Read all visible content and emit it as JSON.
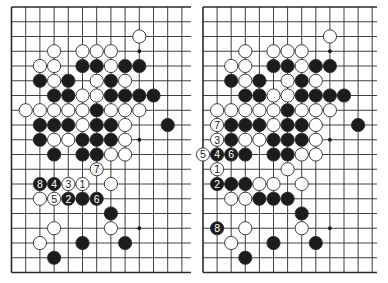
{
  "figure": {
    "colors": {
      "line": "#2a2a2a",
      "black_stone": "#1c1c1c",
      "white_stone": "#ffffff",
      "stone_outline": "#2a2a2a",
      "star_point": "#1c1c1c",
      "background": "#ffffff"
    }
  },
  "boards": [
    {
      "id": "left",
      "origin_x": 11.5,
      "origin_y": 7,
      "spacing_x": 14.2,
      "spacing_y": 14.75,
      "cols": 13,
      "rows": 19,
      "line_extend_right": 191,
      "right_edge_open": true,
      "star_points": [
        [
          9,
          3
        ],
        [
          9,
          9
        ],
        [
          9,
          15
        ]
      ],
      "stones": [
        {
          "c": 9,
          "r": 2,
          "color": "W"
        },
        {
          "c": 3,
          "r": 3,
          "color": "W"
        },
        {
          "c": 5,
          "r": 3,
          "color": "W"
        },
        {
          "c": 6,
          "r": 3,
          "color": "W"
        },
        {
          "c": 7,
          "r": 3,
          "color": "W"
        },
        {
          "c": 2,
          "r": 4,
          "color": "W"
        },
        {
          "c": 3,
          "r": 4,
          "color": "W"
        },
        {
          "c": 5,
          "r": 4,
          "color": "B"
        },
        {
          "c": 6,
          "r": 4,
          "color": "B"
        },
        {
          "c": 7,
          "r": 4,
          "color": "W"
        },
        {
          "c": 8,
          "r": 4,
          "color": "B"
        },
        {
          "c": 9,
          "r": 4,
          "color": "B"
        },
        {
          "c": 2,
          "r": 5,
          "color": "B"
        },
        {
          "c": 3,
          "r": 5,
          "color": "W"
        },
        {
          "c": 4,
          "r": 5,
          "color": "B"
        },
        {
          "c": 6,
          "r": 5,
          "color": "W"
        },
        {
          "c": 7,
          "r": 5,
          "color": "B"
        },
        {
          "c": 8,
          "r": 5,
          "color": "W"
        },
        {
          "c": 3,
          "r": 6,
          "color": "B"
        },
        {
          "c": 4,
          "r": 6,
          "color": "B"
        },
        {
          "c": 5,
          "r": 6,
          "color": "W"
        },
        {
          "c": 6,
          "r": 6,
          "color": "W"
        },
        {
          "c": 7,
          "r": 6,
          "color": "B"
        },
        {
          "c": 8,
          "r": 6,
          "color": "B"
        },
        {
          "c": 9,
          "r": 6,
          "color": "B"
        },
        {
          "c": 10,
          "r": 6,
          "color": "B"
        },
        {
          "c": 1,
          "r": 7,
          "color": "W"
        },
        {
          "c": 2,
          "r": 7,
          "color": "W"
        },
        {
          "c": 3,
          "r": 7,
          "color": "W"
        },
        {
          "c": 4,
          "r": 7,
          "color": "W"
        },
        {
          "c": 5,
          "r": 7,
          "color": "W"
        },
        {
          "c": 6,
          "r": 7,
          "color": "B"
        },
        {
          "c": 7,
          "r": 7,
          "color": "W"
        },
        {
          "c": 8,
          "r": 7,
          "color": "W"
        },
        {
          "c": 9,
          "r": 7,
          "color": "W"
        },
        {
          "c": 2,
          "r": 8,
          "color": "B"
        },
        {
          "c": 3,
          "r": 8,
          "color": "B"
        },
        {
          "c": 4,
          "r": 8,
          "color": "B"
        },
        {
          "c": 5,
          "r": 8,
          "color": "W"
        },
        {
          "c": 6,
          "r": 8,
          "color": "B"
        },
        {
          "c": 7,
          "r": 8,
          "color": "B"
        },
        {
          "c": 8,
          "r": 8,
          "color": "W"
        },
        {
          "c": 11,
          "r": 8,
          "color": "B"
        },
        {
          "c": 2,
          "r": 9,
          "color": "B"
        },
        {
          "c": 3,
          "r": 9,
          "color": "W"
        },
        {
          "c": 4,
          "r": 9,
          "color": "W"
        },
        {
          "c": 5,
          "r": 9,
          "color": "B"
        },
        {
          "c": 6,
          "r": 9,
          "color": "B"
        },
        {
          "c": 7,
          "r": 9,
          "color": "B"
        },
        {
          "c": 8,
          "r": 9,
          "color": "W"
        },
        {
          "c": 3,
          "r": 10,
          "color": "B"
        },
        {
          "c": 5,
          "r": 10,
          "color": "B"
        },
        {
          "c": 6,
          "r": 10,
          "color": "B"
        },
        {
          "c": 7,
          "r": 10,
          "color": "W"
        },
        {
          "c": 8,
          "r": 10,
          "color": "W"
        },
        {
          "c": 6,
          "r": 11,
          "color": "W",
          "label": "7"
        },
        {
          "c": 2,
          "r": 12,
          "color": "B",
          "label": "8"
        },
        {
          "c": 3,
          "r": 12,
          "color": "B",
          "label": "4"
        },
        {
          "c": 4,
          "r": 12,
          "color": "W",
          "label": "3"
        },
        {
          "c": 5,
          "r": 12,
          "color": "W",
          "label": "1"
        },
        {
          "c": 7,
          "r": 12,
          "color": "W"
        },
        {
          "c": 2,
          "r": 13,
          "color": "W"
        },
        {
          "c": 3,
          "r": 13,
          "color": "W",
          "label": "5"
        },
        {
          "c": 4,
          "r": 13,
          "color": "B",
          "label": "2"
        },
        {
          "c": 5,
          "r": 13,
          "color": "B"
        },
        {
          "c": 6,
          "r": 13,
          "color": "B",
          "label": "6"
        },
        {
          "c": 7,
          "r": 14,
          "color": "B"
        },
        {
          "c": 3,
          "r": 15,
          "color": "W"
        },
        {
          "c": 7,
          "r": 15,
          "color": "W"
        },
        {
          "c": 2,
          "r": 16,
          "color": "W"
        },
        {
          "c": 5,
          "r": 16,
          "color": "B"
        },
        {
          "c": 8,
          "r": 16,
          "color": "B"
        },
        {
          "c": 3,
          "r": 17,
          "color": "B"
        }
      ]
    },
    {
      "id": "right",
      "origin_x": 203,
      "origin_y": 7,
      "spacing_x": 14.1,
      "spacing_y": 14.75,
      "cols": 13,
      "rows": 19,
      "line_extend_right": 377,
      "right_edge_open": true,
      "star_points": [
        [
          9,
          3
        ],
        [
          9,
          9
        ],
        [
          9,
          15
        ]
      ],
      "stones": [
        {
          "c": 9,
          "r": 2,
          "color": "W"
        },
        {
          "c": 3,
          "r": 3,
          "color": "W"
        },
        {
          "c": 5,
          "r": 3,
          "color": "W"
        },
        {
          "c": 6,
          "r": 3,
          "color": "W"
        },
        {
          "c": 7,
          "r": 3,
          "color": "W"
        },
        {
          "c": 2,
          "r": 4,
          "color": "W"
        },
        {
          "c": 3,
          "r": 4,
          "color": "W"
        },
        {
          "c": 5,
          "r": 4,
          "color": "B"
        },
        {
          "c": 6,
          "r": 4,
          "color": "B"
        },
        {
          "c": 7,
          "r": 4,
          "color": "W"
        },
        {
          "c": 8,
          "r": 4,
          "color": "B"
        },
        {
          "c": 9,
          "r": 4,
          "color": "B"
        },
        {
          "c": 2,
          "r": 5,
          "color": "B"
        },
        {
          "c": 3,
          "r": 5,
          "color": "W"
        },
        {
          "c": 4,
          "r": 5,
          "color": "B"
        },
        {
          "c": 6,
          "r": 5,
          "color": "W"
        },
        {
          "c": 7,
          "r": 5,
          "color": "B"
        },
        {
          "c": 8,
          "r": 5,
          "color": "W"
        },
        {
          "c": 3,
          "r": 6,
          "color": "B"
        },
        {
          "c": 4,
          "r": 6,
          "color": "B"
        },
        {
          "c": 5,
          "r": 6,
          "color": "W"
        },
        {
          "c": 6,
          "r": 6,
          "color": "W"
        },
        {
          "c": 7,
          "r": 6,
          "color": "B"
        },
        {
          "c": 8,
          "r": 6,
          "color": "B"
        },
        {
          "c": 9,
          "r": 6,
          "color": "B"
        },
        {
          "c": 10,
          "r": 6,
          "color": "B"
        },
        {
          "c": 1,
          "r": 7,
          "color": "W"
        },
        {
          "c": 2,
          "r": 7,
          "color": "W"
        },
        {
          "c": 3,
          "r": 7,
          "color": "W"
        },
        {
          "c": 4,
          "r": 7,
          "color": "W"
        },
        {
          "c": 5,
          "r": 7,
          "color": "W"
        },
        {
          "c": 6,
          "r": 7,
          "color": "B"
        },
        {
          "c": 7,
          "r": 7,
          "color": "W"
        },
        {
          "c": 8,
          "r": 7,
          "color": "W"
        },
        {
          "c": 9,
          "r": 7,
          "color": "W"
        },
        {
          "c": 1,
          "r": 8,
          "color": "W",
          "label": "7"
        },
        {
          "c": 2,
          "r": 8,
          "color": "B"
        },
        {
          "c": 3,
          "r": 8,
          "color": "B"
        },
        {
          "c": 4,
          "r": 8,
          "color": "B"
        },
        {
          "c": 5,
          "r": 8,
          "color": "W"
        },
        {
          "c": 6,
          "r": 8,
          "color": "B"
        },
        {
          "c": 7,
          "r": 8,
          "color": "B"
        },
        {
          "c": 8,
          "r": 8,
          "color": "W"
        },
        {
          "c": 11,
          "r": 8,
          "color": "B"
        },
        {
          "c": 1,
          "r": 9,
          "color": "W",
          "label": "3"
        },
        {
          "c": 2,
          "r": 9,
          "color": "B"
        },
        {
          "c": 3,
          "r": 9,
          "color": "W"
        },
        {
          "c": 4,
          "r": 9,
          "color": "W"
        },
        {
          "c": 5,
          "r": 9,
          "color": "B"
        },
        {
          "c": 6,
          "r": 9,
          "color": "B"
        },
        {
          "c": 7,
          "r": 9,
          "color": "B"
        },
        {
          "c": 8,
          "r": 9,
          "color": "W"
        },
        {
          "c": 0,
          "r": 10,
          "color": "W",
          "label": "5"
        },
        {
          "c": 1,
          "r": 10,
          "color": "B",
          "label": "4"
        },
        {
          "c": 2,
          "r": 10,
          "color": "B",
          "label": "6"
        },
        {
          "c": 3,
          "r": 10,
          "color": "B"
        },
        {
          "c": 5,
          "r": 10,
          "color": "B"
        },
        {
          "c": 6,
          "r": 10,
          "color": "B"
        },
        {
          "c": 7,
          "r": 10,
          "color": "W"
        },
        {
          "c": 8,
          "r": 10,
          "color": "W"
        },
        {
          "c": 1,
          "r": 11,
          "color": "W",
          "label": "1"
        },
        {
          "c": 6,
          "r": 11,
          "color": "W"
        },
        {
          "c": 1,
          "r": 12,
          "color": "B",
          "label": "2"
        },
        {
          "c": 2,
          "r": 12,
          "color": "B"
        },
        {
          "c": 3,
          "r": 12,
          "color": "B"
        },
        {
          "c": 4,
          "r": 12,
          "color": "W"
        },
        {
          "c": 5,
          "r": 12,
          "color": "W"
        },
        {
          "c": 7,
          "r": 12,
          "color": "W"
        },
        {
          "c": 2,
          "r": 13,
          "color": "W"
        },
        {
          "c": 3,
          "r": 13,
          "color": "W"
        },
        {
          "c": 4,
          "r": 13,
          "color": "B"
        },
        {
          "c": 5,
          "r": 13,
          "color": "B"
        },
        {
          "c": 6,
          "r": 13,
          "color": "B"
        },
        {
          "c": 7,
          "r": 14,
          "color": "B"
        },
        {
          "c": 1,
          "r": 15,
          "color": "B",
          "label": "8"
        },
        {
          "c": 3,
          "r": 15,
          "color": "W"
        },
        {
          "c": 7,
          "r": 15,
          "color": "W"
        },
        {
          "c": 2,
          "r": 16,
          "color": "W"
        },
        {
          "c": 5,
          "r": 16,
          "color": "B"
        },
        {
          "c": 8,
          "r": 16,
          "color": "B"
        },
        {
          "c": 3,
          "r": 17,
          "color": "B"
        }
      ]
    }
  ]
}
